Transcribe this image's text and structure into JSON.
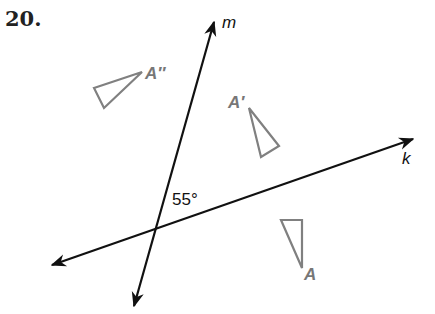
{
  "problem": {
    "number": "20."
  },
  "lines": {
    "m": {
      "label": "m",
      "start": [
        134,
        306
      ],
      "end": [
        214,
        22
      ],
      "color": "#111111"
    },
    "k": {
      "label": "k",
      "start": [
        52,
        265
      ],
      "end": [
        413,
        139
      ],
      "color": "#111111"
    }
  },
  "angle": {
    "label": "55°"
  },
  "triangles": {
    "A": {
      "label": "A",
      "points": "281,220 302,220 302,268",
      "color": "#808080"
    },
    "A_prime": {
      "label": "A′",
      "points": "249,108 279,146 261,157",
      "color": "#808080"
    },
    "A_double_prime": {
      "label": "A″",
      "points": "94,88 142,72 104,108",
      "color": "#808080"
    }
  }
}
